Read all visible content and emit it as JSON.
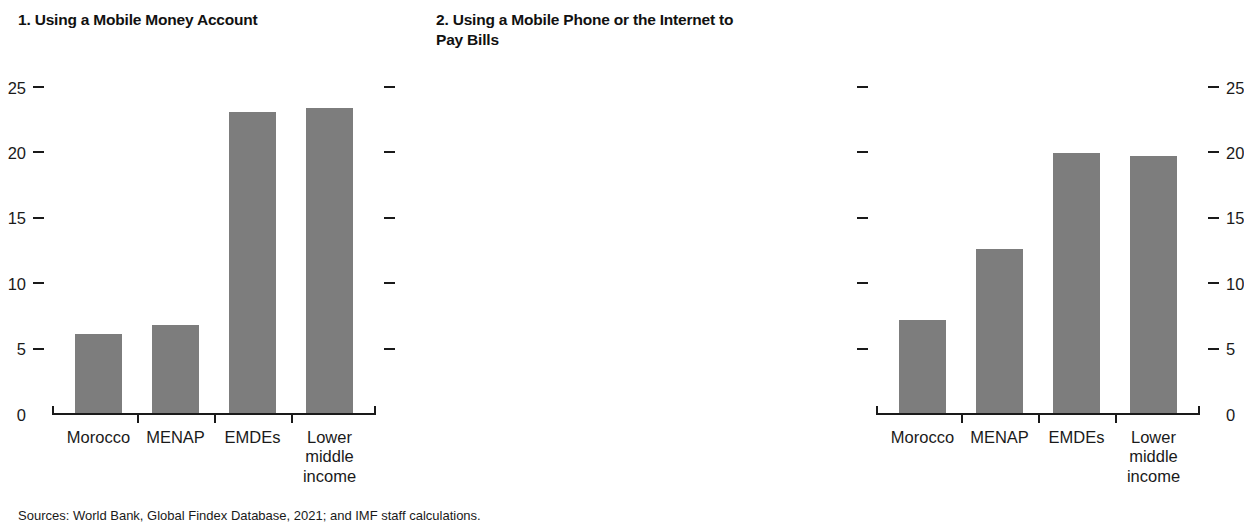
{
  "source_note": "Sources: World Bank, Global Findex Database, 2021; and IMF staff calculations.",
  "panels": [
    {
      "title": "1. Using a Mobile Money Account",
      "axis_side": "left"
    },
    {
      "title": "2. Using a Mobile Phone or the Internet to\nPay Bills",
      "axis_side": "right"
    }
  ],
  "axis": {
    "ticks": [
      "0",
      "5",
      "10",
      "15",
      "20",
      "25"
    ]
  },
  "chart_data": [
    {
      "type": "bar",
      "title": "1. Using a Mobile Money Account",
      "categories": [
        "Morocco",
        "MENAP",
        "EMDEs",
        "Lower\nmiddle\nincome"
      ],
      "values": [
        6.2,
        6.9,
        23.2,
        23.5
      ],
      "xlabel": "",
      "ylabel": "",
      "ylim": [
        0,
        25
      ],
      "yticks": [
        0,
        5,
        10,
        15,
        20,
        25
      ],
      "grid": false,
      "legend": "none",
      "axis_position": "left",
      "bar_color": "#7d7d7d"
    },
    {
      "type": "bar",
      "title": "2. Using a Mobile Phone or the Internet to Pay Bills",
      "categories": [
        "Morocco",
        "MENAP",
        "EMDEs",
        "Lower\nmiddle\nincome"
      ],
      "values": [
        7.3,
        12.7,
        20.0,
        19.8
      ],
      "xlabel": "",
      "ylabel": "",
      "ylim": [
        0,
        25
      ],
      "yticks": [
        0,
        5,
        10,
        15,
        20,
        25
      ],
      "grid": false,
      "legend": "none",
      "axis_position": "right",
      "bar_color": "#7d7d7d"
    }
  ]
}
